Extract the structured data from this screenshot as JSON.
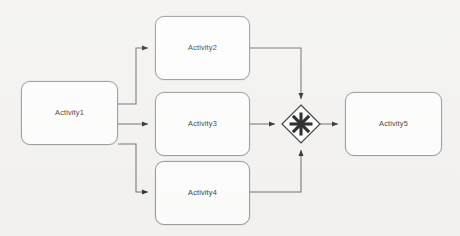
{
  "diagram": {
    "type": "bpmn-process-flow",
    "background_color": "#f2f1ef",
    "stroke_color": "#555555",
    "node_fill": "#fdfdfd",
    "node_border": "#8b8b8b",
    "text_color": "#141414",
    "nodes": [
      {
        "id": "activity1",
        "label": "Activity1",
        "shape": "rounded-rect",
        "x": 21,
        "y": 81,
        "w": 97,
        "h": 64
      },
      {
        "id": "activity2",
        "label": "Activity2",
        "shape": "rounded-rect",
        "x": 155,
        "y": 16,
        "w": 95,
        "h": 64
      },
      {
        "id": "activity3",
        "label": "Activity3",
        "shape": "rounded-rect",
        "x": 155,
        "y": 92,
        "w": 95,
        "h": 64
      },
      {
        "id": "activity4",
        "label": "Activity4",
        "shape": "rounded-rect",
        "x": 155,
        "y": 161,
        "w": 95,
        "h": 64
      },
      {
        "id": "activity5",
        "label": "Activity5",
        "shape": "rounded-rect",
        "x": 345,
        "y": 92,
        "w": 97,
        "h": 64
      }
    ],
    "gateway": {
      "id": "complex-gateway",
      "shape": "diamond",
      "glyph": "asterisk",
      "glyph_char": "✳",
      "cx": 301,
      "cy": 124,
      "half": 19,
      "label": ""
    },
    "edges": [
      {
        "id": "e1",
        "from": "activity1",
        "to": "activity2",
        "routing": "orthogonal-up"
      },
      {
        "id": "e2",
        "from": "activity1",
        "to": "activity3",
        "routing": "straight"
      },
      {
        "id": "e3",
        "from": "activity1",
        "to": "activity4",
        "routing": "orthogonal-down"
      },
      {
        "id": "e4",
        "from": "activity2",
        "to": "complex-gateway",
        "routing": "orthogonal-down"
      },
      {
        "id": "e5",
        "from": "activity3",
        "to": "complex-gateway",
        "routing": "straight"
      },
      {
        "id": "e6",
        "from": "activity4",
        "to": "complex-gateway",
        "routing": "orthogonal-up"
      },
      {
        "id": "e7",
        "from": "complex-gateway",
        "to": "activity5",
        "routing": "straight"
      }
    ]
  }
}
